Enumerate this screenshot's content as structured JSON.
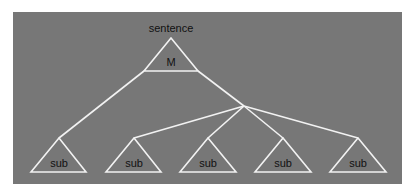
{
  "diagram": {
    "background_color": "#ffffff",
    "panel_color": "#777777",
    "line_color": "#f2f2f2",
    "text_color": "#111111",
    "root": {
      "title": "sentence",
      "label": "M"
    },
    "children": [
      {
        "label": "sub"
      },
      {
        "label": "sub"
      },
      {
        "label": "sub"
      },
      {
        "label": "sub"
      },
      {
        "label": "sub"
      }
    ]
  }
}
